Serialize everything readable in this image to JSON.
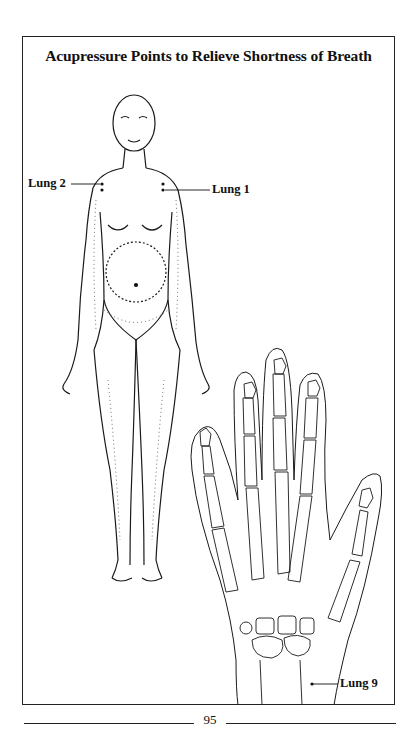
{
  "figure": {
    "title": "Acupressure Points to Relieve Shortness of Breath",
    "labels": {
      "lung2": "Lung 2",
      "lung1": "Lung 1",
      "lung9": "Lung 9"
    },
    "illustrations": [
      "full-body-figure",
      "hand-skeleton"
    ]
  },
  "footer": {
    "page_number": "95"
  },
  "colors": {
    "ink": "#111111",
    "paper": "#ffffff"
  }
}
